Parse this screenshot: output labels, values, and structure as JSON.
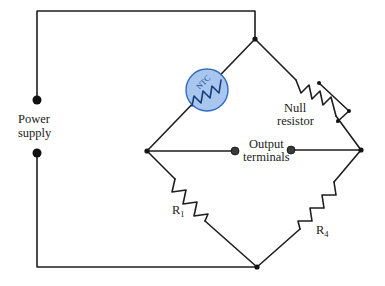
{
  "diagram": {
    "type": "Wheatstone bridge circuit with NTC thermistor",
    "colors": {
      "wire": "#1e1e1e",
      "thermistor_fill": "#a9c6ef",
      "thermistor_stroke": "#2f6bc4",
      "background": "#ffffff"
    },
    "labels": {
      "power_supply_line1": "Power",
      "power_supply_line2": "supply",
      "null_resistor_line1": "Null",
      "null_resistor_line2": "resistor",
      "output_line1": "Output",
      "output_line2": "terminals",
      "r1_main": "R",
      "r1_sub": "1",
      "r4_main": "R",
      "r4_sub": "4",
      "thermistor": "NTC"
    },
    "components": [
      {
        "id": "ntc-thermistor",
        "label": "NTC",
        "position": "upper-left bridge arm"
      },
      {
        "id": "null-resistor",
        "label": "Null resistor",
        "position": "upper-right bridge arm",
        "variable": true
      },
      {
        "id": "r1",
        "label": "R1",
        "position": "lower-left bridge arm"
      },
      {
        "id": "r4",
        "label": "R4",
        "position": "lower-right bridge arm"
      },
      {
        "id": "power-supply",
        "label": "Power supply",
        "terminals": 2
      },
      {
        "id": "output-terminals",
        "label": "Output terminals",
        "terminals": 2
      }
    ]
  }
}
